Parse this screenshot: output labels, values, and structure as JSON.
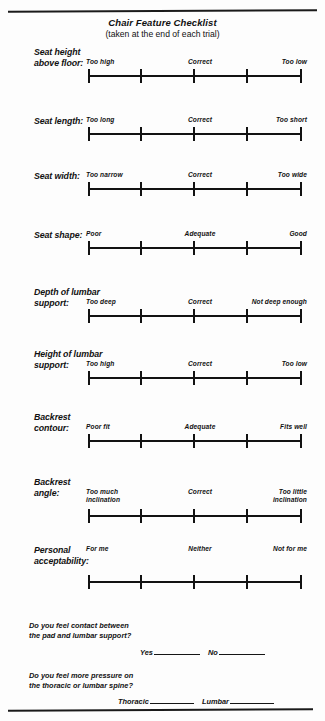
{
  "document": {
    "title": "Chair Feature Checklist",
    "subtitle": "(taken at the end of each trial)"
  },
  "scale": {
    "tick_count": 5,
    "line_color": "#121212"
  },
  "rows": [
    {
      "label": "Seat height\nabove floor:",
      "label_lines": [
        "Seat height",
        "above floor:"
      ],
      "left_anchor": "Too high",
      "mid_anchor": "Correct",
      "right_anchor": "Too low"
    },
    {
      "label": "Seat length:",
      "label_lines": [
        "Seat length:"
      ],
      "left_anchor": "Too long",
      "mid_anchor": "Correct",
      "right_anchor": "Too short"
    },
    {
      "label": "Seat width:",
      "label_lines": [
        "Seat width:"
      ],
      "left_anchor": "Too narrow",
      "mid_anchor": "Correct",
      "right_anchor": "Too wide"
    },
    {
      "label": "Seat shape:",
      "label_lines": [
        "Seat shape:"
      ],
      "left_anchor": "Poor",
      "mid_anchor": "Adequate",
      "right_anchor": "Good"
    },
    {
      "label": "Depth of lumbar\nsupport:",
      "label_lines": [
        "Depth of lumbar",
        "support:"
      ],
      "left_anchor": "Too deep",
      "mid_anchor": "Correct",
      "right_anchor": "Not deep enough"
    },
    {
      "label": "Height of lumbar\nsupport:",
      "label_lines": [
        "Height of lumbar",
        "support:"
      ],
      "left_anchor": "Too high",
      "mid_anchor": "Correct",
      "right_anchor": "Too low"
    },
    {
      "label": "Backrest\ncontour:",
      "label_lines": [
        "Backrest",
        "contour:"
      ],
      "left_anchor": "Poor fit",
      "mid_anchor": "Adequate",
      "right_anchor": "Fits well"
    },
    {
      "label": "Backrest\nangle:",
      "label_lines": [
        "Backrest",
        "angle:"
      ],
      "left_anchor": "Too much",
      "left_anchor_line2": "inclination",
      "mid_anchor": "Correct",
      "right_anchor": "Too little",
      "right_anchor_line2": "inclination"
    },
    {
      "label": "Personal\nacceptability:",
      "label_lines": [
        "Personal",
        "acceptability:"
      ],
      "left_anchor": "For me",
      "mid_anchor": "Neither",
      "right_anchor": "Not for me"
    }
  ],
  "questions": [
    {
      "text_lines": [
        "Do you feel contact between",
        "the pad and lumbar support?"
      ],
      "answers": [
        "Yes",
        "No"
      ]
    },
    {
      "text_lines": [
        "Do you feel more pressure on",
        "the thoracic or lumbar spine?"
      ],
      "answers": [
        "Thoracic",
        "Lumbar"
      ]
    }
  ]
}
